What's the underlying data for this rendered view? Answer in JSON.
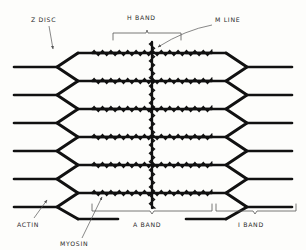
{
  "figure": {
    "style": "hand-drawn pen sketch",
    "background_color": "#fdfdfb",
    "ink_color": "#111111",
    "label_color": "#2b2b2b"
  },
  "labels": {
    "z_disc": "Z DISC",
    "h_band": "H BAND",
    "m_line": "M LINE",
    "actin": "ACTIN",
    "myosin": "MYOSIN",
    "a_band": "A BAND",
    "i_band": "I BAND"
  },
  "geometry": {
    "width": 306,
    "height": 250,
    "z_disc_left_x": 57,
    "z_disc_right_x": 247,
    "m_line_x": 152,
    "m_line_top_y": 42,
    "m_line_bottom_y": 208,
    "myosin_left_x": 92,
    "myosin_right_x": 212,
    "rows": 6,
    "row_top_y": 53,
    "row_spacing": 28
  },
  "brackets": {
    "h_band": {
      "x1": 113,
      "x2": 181,
      "y": 33,
      "label_y": 19
    },
    "a_band": {
      "x1": 92,
      "x2": 212,
      "y": 211,
      "label_y": 225
    },
    "i_band": {
      "x1": 215,
      "x2": 296,
      "y": 211,
      "label_y": 225
    }
  },
  "annotations": {
    "z_disc": {
      "label_x": 31,
      "label_y": 20,
      "arrow_from_x": 49,
      "arrow_from_y": 25,
      "arrow_to_x": 53,
      "arrow_to_y": 50
    },
    "m_line": {
      "label_x": 215,
      "label_y": 22,
      "arrow_from_x": 212,
      "arrow_from_y": 25,
      "arrow_to_x": 156,
      "arrow_to_y": 48
    },
    "actin": {
      "label_x": 17,
      "label_y": 225,
      "arrow_from_x": 34,
      "arrow_from_y": 218,
      "arrow_to_x": 47,
      "arrow_to_y": 198
    },
    "myosin": {
      "label_x": 62,
      "label_y": 245,
      "arrow_from_x": 82,
      "arrow_from_y": 238,
      "arrow_to_x": 102,
      "arrow_to_y": 196
    }
  }
}
